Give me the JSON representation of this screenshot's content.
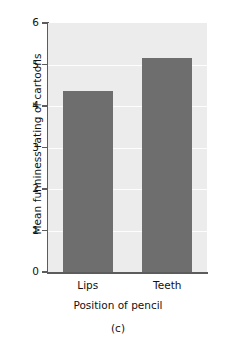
{
  "chart_data": {
    "type": "bar",
    "title": "",
    "categories": [
      "Lips",
      "Teeth"
    ],
    "values": [
      4.35,
      5.15
    ],
    "xlabel": "Position of pencil",
    "ylabel": "Mean funniness rating of cartoons",
    "ylim": [
      0,
      6
    ],
    "yticks": [
      0,
      1,
      2,
      3,
      4,
      5,
      6
    ],
    "ytick_labels": [
      "0",
      "1",
      "2",
      "3",
      "4",
      "5",
      "6"
    ],
    "grid": true,
    "grid_axis": "y",
    "legend": false,
    "legend_position": "none",
    "caption": "(c)",
    "colors": {
      "bar": "#6e6e6e",
      "plot_background": "#ececec",
      "grid_line": "#fdfdfd",
      "axis": "#5c5c5c",
      "text": "#111111",
      "figure_background": "#ffffff"
    }
  },
  "axis": {
    "y_title": "Mean funniness rating of cartoons",
    "x_title": "Position of pencil"
  },
  "caption": {
    "text": "(c)"
  }
}
